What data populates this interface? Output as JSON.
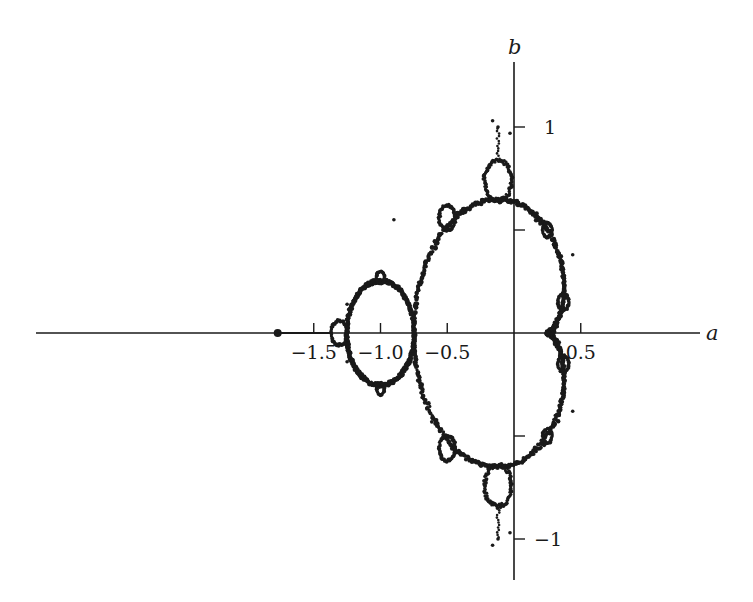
{
  "chart_data": {
    "type": "scatter",
    "title": "",
    "xlabel": "a",
    "ylabel": "b",
    "xlim": [
      -1.88,
      0.72
    ],
    "ylim": [
      -1.2,
      1.2
    ],
    "grid": false,
    "legend": null,
    "x_ticks": [
      {
        "value": -1.5,
        "label": "−1.5"
      },
      {
        "value": -1.0,
        "label": "−1.0"
      },
      {
        "value": -0.5,
        "label": "−0.5"
      },
      {
        "value": 0.5,
        "label": "0.5"
      }
    ],
    "y_ticks": [
      {
        "value": 1,
        "label": "1"
      },
      {
        "value": 0.5,
        "label": ""
      },
      {
        "value": -0.5,
        "label": ""
      },
      {
        "value": -1,
        "label": "−1"
      }
    ],
    "features": {
      "main_cardioid": {
        "cusp": [
          -0.75,
          0
        ],
        "right_tip": [
          0.25,
          0
        ]
      },
      "period2_disc": {
        "center": [
          -1.0,
          0
        ],
        "radius": 0.25
      },
      "left_bulb": {
        "center": [
          -1.31,
          0
        ],
        "radius": 0.06
      },
      "top_bulb": {
        "center": [
          -0.12,
          0.74
        ],
        "radius": 0.1
      },
      "bottom_bulb": {
        "center": [
          -0.12,
          -0.74
        ],
        "radius": 0.1
      },
      "isolated_point": [
        -1.77,
        0
      ]
    },
    "series": [
      {
        "name": "boundary points",
        "color": "#1a1a1a"
      }
    ]
  },
  "colors": {
    "ink": "#1a1a1a",
    "background": "#ffffff"
  }
}
